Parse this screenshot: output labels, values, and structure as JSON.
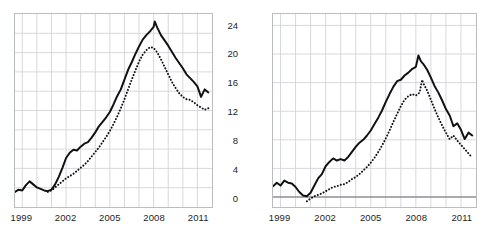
{
  "figure": {
    "title": "",
    "background": "#ffffff",
    "frame_color": "#b9bcc0",
    "grid_color": "#d6d8db",
    "zero_line_color": "#8d9094",
    "series_color": "#111111"
  },
  "panels": [
    {
      "id": "left",
      "name": "left-panel",
      "x_labels": [
        "1999",
        "2002",
        "2005",
        "2008",
        "2011"
      ]
    },
    {
      "id": "right",
      "name": "right-panel",
      "x_labels": [
        "1999",
        "2002",
        "2005",
        "2008",
        "2011"
      ],
      "y_labels": [
        "24",
        "20",
        "16",
        "12",
        "8",
        "4",
        "0"
      ]
    }
  ],
  "chart_data": [
    {
      "type": "line",
      "panel": "left",
      "title": "",
      "xlabel": "",
      "ylabel": "",
      "xlim": [
        1998.5,
        2012.0
      ],
      "ylim": [
        0,
        25.6
      ],
      "xticks": [
        1999,
        2002,
        2005,
        2008,
        2011
      ],
      "xticklabels": [
        "1999",
        "2002",
        "2005",
        "2008",
        "2011"
      ],
      "yticks": [],
      "yticklabels": [],
      "grid": true,
      "grid_x_minor_every": 1,
      "grid_y_every": 2.56,
      "legend": "none",
      "series": [
        {
          "name": "solid-series",
          "style": "solid",
          "color": "#111111",
          "x": [
            1998.5,
            1998.75,
            1999,
            1999.25,
            1999.5,
            1999.75,
            2000,
            2000.25,
            2000.5,
            2000.75,
            2001,
            2001.25,
            2001.5,
            2001.75,
            2002,
            2002.25,
            2002.5,
            2002.75,
            2003,
            2003.25,
            2003.5,
            2003.75,
            2004,
            2004.25,
            2004.5,
            2004.75,
            2005,
            2005.25,
            2005.5,
            2005.75,
            2006,
            2006.25,
            2006.5,
            2006.75,
            2007,
            2007.25,
            2007.5,
            2007.75,
            2008,
            2008.08,
            2008.25,
            2008.5,
            2008.75,
            2009,
            2009.25,
            2009.5,
            2009.75,
            2010,
            2010.25,
            2010.5,
            2010.75,
            2011,
            2011.25,
            2011.5,
            2011.75
          ],
          "y": [
            2.0,
            2.3,
            2.2,
            2.9,
            3.4,
            3.0,
            2.6,
            2.4,
            2.2,
            2.1,
            2.3,
            3.0,
            4.0,
            5.2,
            6.5,
            7.2,
            7.6,
            7.5,
            8.0,
            8.4,
            8.6,
            9.2,
            9.9,
            10.7,
            11.3,
            11.9,
            12.6,
            13.6,
            14.7,
            15.6,
            16.9,
            18.2,
            19.2,
            20.3,
            21.3,
            22.2,
            22.8,
            23.3,
            23.9,
            24.6,
            23.8,
            22.8,
            22.1,
            21.4,
            20.6,
            19.8,
            19.1,
            18.4,
            17.6,
            17.1,
            16.6,
            16.0,
            14.6,
            15.6,
            15.2
          ]
        },
        {
          "name": "dotted-series",
          "style": "dotted",
          "color": "#111111",
          "x": [
            2000.75,
            2001,
            2001.25,
            2001.5,
            2001.75,
            2002,
            2002.25,
            2002.5,
            2002.75,
            2003,
            2003.25,
            2003.5,
            2003.75,
            2004,
            2004.25,
            2004.5,
            2004.75,
            2005,
            2005.25,
            2005.5,
            2005.75,
            2006,
            2006.25,
            2006.5,
            2006.75,
            2007,
            2007.25,
            2007.5,
            2007.75,
            2008,
            2008.25,
            2008.5,
            2008.75,
            2009,
            2009.25,
            2009.5,
            2009.75,
            2010,
            2010.25,
            2010.5,
            2010.75,
            2011,
            2011.25,
            2011.5,
            2011.75
          ],
          "y": [
            2.0,
            2.2,
            2.6,
            3.0,
            3.4,
            3.8,
            4.1,
            4.4,
            4.8,
            5.2,
            5.6,
            6.1,
            6.7,
            7.3,
            7.9,
            8.6,
            9.3,
            10.1,
            11.0,
            12.0,
            13.1,
            14.3,
            15.6,
            16.9,
            18.1,
            19.3,
            20.2,
            20.8,
            21.2,
            21.1,
            20.5,
            19.6,
            18.6,
            17.6,
            16.6,
            15.8,
            15.1,
            14.6,
            14.3,
            14.2,
            13.9,
            13.5,
            13.2,
            12.9,
            13.1
          ]
        }
      ]
    },
    {
      "type": "line",
      "panel": "right",
      "title": "",
      "xlabel": "",
      "ylabel": "",
      "xlim": [
        1998.5,
        2012.0
      ],
      "ylim": [
        -1.4,
        25.6
      ],
      "xticks": [
        1999,
        2002,
        2005,
        2008,
        2011
      ],
      "xticklabels": [
        "1999",
        "2002",
        "2005",
        "2008",
        "2011"
      ],
      "yticks": [
        0,
        4,
        8,
        12,
        16,
        20,
        24
      ],
      "yticklabels": [
        "0",
        "4",
        "8",
        "12",
        "16",
        "20",
        "24"
      ],
      "grid": true,
      "grid_x_minor_every": 1,
      "zero_line": 0,
      "legend": "none",
      "series": [
        {
          "name": "solid-series",
          "style": "solid",
          "color": "#111111",
          "x": [
            1998.5,
            1998.75,
            1999,
            1999.25,
            1999.5,
            1999.75,
            2000,
            2000.25,
            2000.5,
            2000.75,
            2001,
            2001.25,
            2001.5,
            2001.75,
            2002,
            2002.25,
            2002.5,
            2002.75,
            2003,
            2003.25,
            2003.5,
            2003.75,
            2004,
            2004.25,
            2004.5,
            2004.75,
            2005,
            2005.25,
            2005.5,
            2005.75,
            2006,
            2006.25,
            2006.5,
            2006.75,
            2007,
            2007.25,
            2007.5,
            2007.75,
            2008,
            2008.17,
            2008.33,
            2008.5,
            2008.75,
            2009,
            2009.25,
            2009.5,
            2009.75,
            2010,
            2010.25,
            2010.5,
            2010.75,
            2011,
            2011.25,
            2011.5,
            2011.75
          ],
          "y": [
            1.5,
            2.0,
            1.6,
            2.3,
            2.0,
            1.9,
            1.4,
            0.7,
            0.2,
            0.1,
            0.6,
            1.6,
            2.6,
            3.2,
            4.3,
            4.9,
            5.4,
            5.1,
            5.3,
            5.1,
            5.6,
            6.3,
            7.0,
            7.6,
            8.0,
            8.6,
            9.3,
            10.2,
            11.1,
            12.1,
            13.3,
            14.4,
            15.4,
            16.2,
            16.4,
            17.0,
            17.4,
            17.9,
            18.2,
            19.8,
            19.0,
            18.6,
            17.8,
            16.7,
            15.5,
            14.6,
            13.5,
            12.3,
            11.4,
            9.9,
            10.3,
            9.4,
            8.1,
            9.0,
            8.6
          ]
        },
        {
          "name": "dotted-series",
          "style": "dotted",
          "color": "#111111",
          "x": [
            2000.75,
            2001,
            2001.25,
            2001.5,
            2001.75,
            2002,
            2002.25,
            2002.5,
            2002.75,
            2003,
            2003.25,
            2003.5,
            2003.75,
            2004,
            2004.25,
            2004.5,
            2004.75,
            2005,
            2005.25,
            2005.5,
            2005.75,
            2006,
            2006.25,
            2006.5,
            2006.75,
            2007,
            2007.25,
            2007.5,
            2007.75,
            2008,
            2008.25,
            2008.42,
            2008.5,
            2008.75,
            2009,
            2009.25,
            2009.5,
            2009.75,
            2010,
            2010.25,
            2010.5,
            2010.75,
            2011,
            2011.25,
            2011.5,
            2011.75
          ],
          "y": [
            -0.6,
            -0.2,
            0.1,
            0.3,
            0.5,
            0.8,
            1.1,
            1.4,
            1.5,
            1.7,
            1.8,
            2.1,
            2.5,
            2.8,
            3.2,
            3.7,
            4.2,
            4.8,
            5.5,
            6.3,
            7.2,
            8.2,
            9.3,
            10.5,
            11.6,
            12.7,
            13.6,
            14.1,
            14.4,
            14.2,
            14.6,
            16.4,
            15.9,
            14.9,
            13.6,
            12.3,
            11.1,
            10.0,
            9.0,
            8.1,
            8.6,
            7.9,
            7.3,
            6.7,
            6.1,
            5.5
          ]
        }
      ]
    }
  ]
}
